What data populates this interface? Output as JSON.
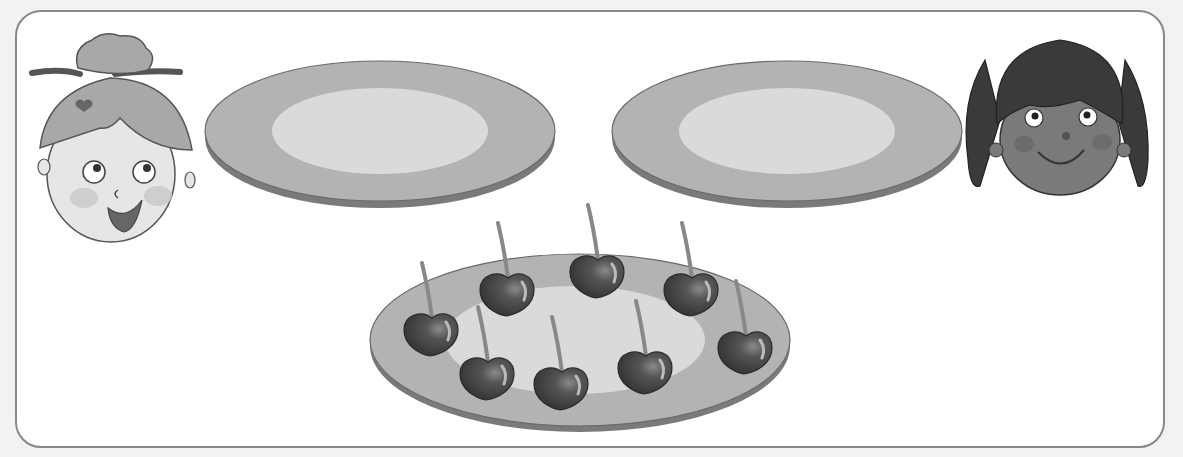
{
  "scene": {
    "description": "Two children and two empty plates; a plate with cherries to share",
    "characters": [
      {
        "id": "girl-left",
        "label": "girl with bun",
        "position": "left"
      },
      {
        "id": "girl-right",
        "label": "girl with pigtails",
        "position": "right"
      }
    ],
    "plates": [
      {
        "id": "plate-left",
        "state": "empty",
        "item_count": 0
      },
      {
        "id": "plate-right",
        "state": "empty",
        "item_count": 0
      },
      {
        "id": "plate-cherries",
        "state": "full",
        "item": "cherry",
        "item_count": 8
      }
    ],
    "colors": {
      "frame_border": "#888888",
      "plate_rim": "#b3b3b3",
      "plate_center": "#dadada",
      "plate_edge": "#7a7a7a",
      "cherry": "#4a4a4a",
      "hair_dark": "#3a3a3a",
      "skin_dark": "#7a7a7a",
      "skin_light": "#e6e6e6",
      "hair_light": "#a8a8a8"
    }
  }
}
